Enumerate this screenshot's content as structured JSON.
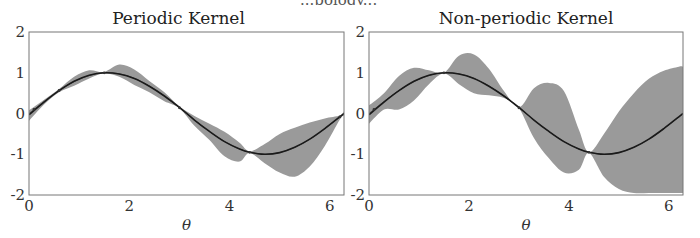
{
  "header": {
    "clipped_text": "...pology..."
  },
  "chart_data": [
    {
      "type": "area",
      "title": "Periodic Kernel",
      "xlabel": "θ",
      "ylabel": "",
      "xlim": [
        0,
        6.283
      ],
      "ylim": [
        -2,
        2
      ],
      "xticks": [
        "0",
        "2",
        "4",
        "6"
      ],
      "yticks": [
        "2",
        "1",
        "0",
        "-1",
        "-2"
      ],
      "grid": false,
      "band_color": "#9a9a9a",
      "mean_color": "#1a1a1a",
      "true_color": "#555555",
      "observations_theta": [
        0.1,
        0.6,
        1.5,
        3.0,
        4.4,
        6.2
      ],
      "x": [
        0.0,
        0.3,
        0.6,
        0.9,
        1.2,
        1.5,
        1.8,
        2.1,
        2.4,
        2.7,
        3.0,
        3.3,
        3.6,
        3.9,
        4.2,
        4.4,
        4.7,
        5.0,
        5.3,
        5.6,
        5.9,
        6.2,
        6.283
      ],
      "mean": [
        -0.03,
        0.28,
        0.56,
        0.79,
        0.94,
        1.0,
        0.97,
        0.86,
        0.67,
        0.43,
        0.15,
        -0.16,
        -0.44,
        -0.69,
        -0.87,
        -0.95,
        -1.0,
        -0.96,
        -0.83,
        -0.63,
        -0.37,
        -0.08,
        0.0
      ],
      "upper": [
        0.08,
        0.34,
        0.6,
        0.9,
        1.06,
        1.02,
        1.2,
        1.08,
        0.8,
        0.52,
        0.17,
        -0.06,
        -0.25,
        -0.45,
        -0.72,
        -0.93,
        -0.75,
        -0.5,
        -0.35,
        -0.22,
        -0.12,
        -0.05,
        0.05
      ],
      "lower": [
        -0.18,
        0.22,
        0.52,
        0.68,
        0.86,
        0.98,
        0.9,
        0.7,
        0.52,
        0.3,
        0.13,
        -0.3,
        -0.65,
        -1.05,
        -1.18,
        -0.97,
        -1.22,
        -1.45,
        -1.55,
        -1.3,
        -0.8,
        -0.15,
        -0.05
      ]
    },
    {
      "type": "area",
      "title": "Non-periodic Kernel",
      "xlabel": "θ",
      "ylabel": "",
      "xlim": [
        0,
        6.283
      ],
      "ylim": [
        -2,
        2
      ],
      "xticks": [
        "0",
        "2",
        "4",
        "6"
      ],
      "yticks": [
        "2",
        "1",
        "0",
        "-1",
        "-2"
      ],
      "grid": false,
      "band_color": "#9a9a9a",
      "mean_color": "#1a1a1a",
      "true_color": "#555555",
      "observations_theta": [
        0.1,
        1.5,
        3.0,
        4.4
      ],
      "x": [
        0.0,
        0.3,
        0.6,
        0.9,
        1.2,
        1.5,
        1.8,
        2.1,
        2.4,
        2.7,
        3.0,
        3.3,
        3.6,
        3.9,
        4.2,
        4.4,
        4.7,
        5.0,
        5.3,
        5.6,
        5.9,
        6.2,
        6.283
      ],
      "mean": [
        -0.03,
        0.28,
        0.56,
        0.79,
        0.94,
        1.0,
        0.97,
        0.86,
        0.67,
        0.43,
        0.15,
        -0.16,
        -0.44,
        -0.69,
        -0.87,
        -0.95,
        -1.0,
        -0.96,
        -0.83,
        -0.63,
        -0.37,
        -0.08,
        0.0
      ],
      "upper": [
        0.2,
        0.5,
        0.92,
        1.12,
        1.06,
        1.0,
        1.42,
        1.45,
        1.1,
        0.55,
        0.15,
        0.62,
        0.75,
        0.55,
        -0.4,
        -0.95,
        -0.5,
        0.05,
        0.5,
        0.85,
        1.05,
        1.15,
        1.15
      ],
      "lower": [
        -0.25,
        0.1,
        0.1,
        0.32,
        0.72,
        0.98,
        0.72,
        0.5,
        0.45,
        0.38,
        0.13,
        -0.6,
        -1.1,
        -1.45,
        -1.38,
        -0.97,
        -1.55,
        -1.85,
        -1.95,
        -1.95,
        -1.95,
        -1.95,
        -1.95
      ]
    }
  ]
}
